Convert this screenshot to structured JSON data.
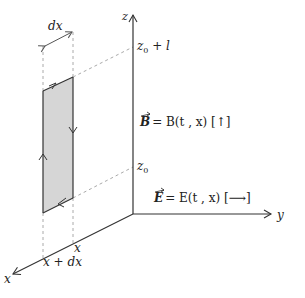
{
  "diagram": {
    "axes": {
      "x": "x",
      "y": "y",
      "z": "z"
    },
    "z_ticks": {
      "upper": {
        "base": "z",
        "sub": "0",
        "suffix": " + l"
      },
      "lower": {
        "base": "z",
        "sub": "0"
      }
    },
    "x_ticks": {
      "near": "x",
      "far": "x + dx"
    },
    "width_label": "dx",
    "equations": {
      "B": {
        "vec": "B",
        "rhs": "= B(t , x) [↑]"
      },
      "E": {
        "vec": "E",
        "rhs": "= E(t , x) [⟶]"
      }
    },
    "colors": {
      "loop_fill": "#d6d6d6",
      "line": "#333333",
      "dashed": "#aaaaaa"
    }
  }
}
